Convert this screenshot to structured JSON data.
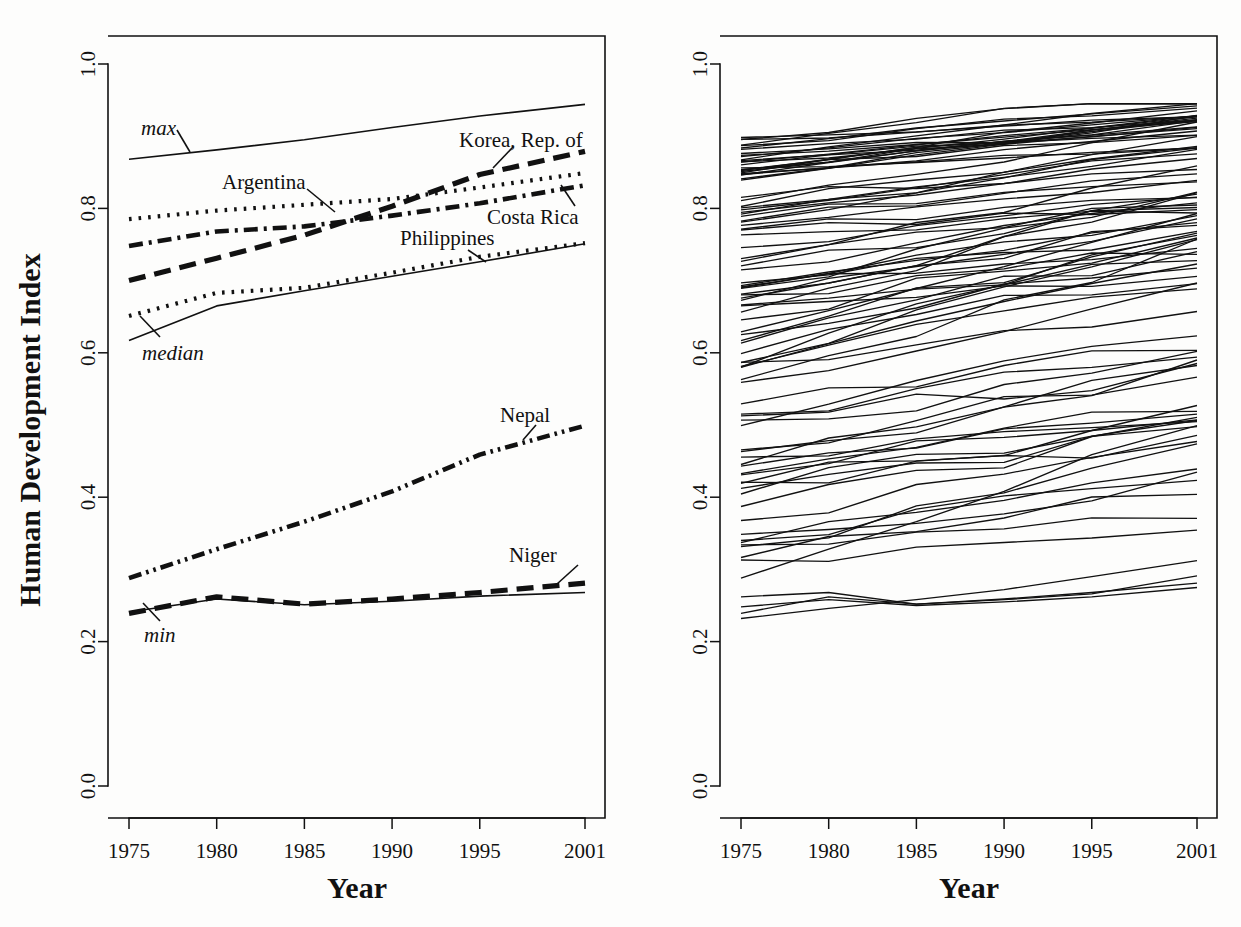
{
  "figure": {
    "panels": [
      {
        "id": "left",
        "xlabel": "Year",
        "ylabel": "Human Development Index"
      },
      {
        "id": "right",
        "xlabel": "Year",
        "ylabel": ""
      }
    ]
  },
  "chart_data": {
    "type": "line",
    "title": "",
    "xlabel": "Year",
    "ylabel": "Human Development Index",
    "xlim": [
      1975,
      2001
    ],
    "ylim": [
      0.0,
      1.0
    ],
    "xticks": [
      1975,
      1980,
      1985,
      1990,
      1995,
      2001
    ],
    "xticklabels": [
      "1975",
      "1980",
      "1985",
      "1990",
      "1995",
      "2001"
    ],
    "yticks": [
      0.0,
      0.2,
      0.4,
      0.6,
      0.8,
      1.0
    ],
    "yticklabels": [
      "0.0",
      "0.2",
      "0.4",
      "0.6",
      "0.8",
      "1.0"
    ],
    "grid": false,
    "legend": "none (direct labels with leader lines)",
    "x": [
      1975,
      1980,
      1985,
      1990,
      1995,
      2001
    ],
    "panels": [
      {
        "name": "left-highlighted-series",
        "description": "Eight highlighted trajectories, direct-labelled on the plot",
        "series": [
          {
            "name": "max",
            "label": "max",
            "style": "solid",
            "values": [
              0.868,
              0.881,
              0.895,
              0.912,
              0.928,
              0.944
            ]
          },
          {
            "name": "Korea, Rep. of",
            "label": "Korea, Rep. of",
            "style": "dashed",
            "values": [
              0.7,
              0.731,
              0.763,
              0.803,
              0.847,
              0.879
            ]
          },
          {
            "name": "Argentina",
            "label": "Argentina",
            "style": "dotted",
            "values": [
              0.785,
              0.797,
              0.805,
              0.813,
              0.829,
              0.849
            ]
          },
          {
            "name": "Costa Rica",
            "label": "Costa Rica",
            "style": "dashdot",
            "values": [
              0.748,
              0.768,
              0.775,
              0.79,
              0.807,
              0.832
            ]
          },
          {
            "name": "Philippines",
            "label": "Philippines",
            "style": "dotted",
            "values": [
              0.651,
              0.683,
              0.69,
              0.711,
              0.733,
              0.752
            ]
          },
          {
            "name": "median",
            "label": "median",
            "style": "solid",
            "values": [
              0.617,
              0.665,
              0.686,
              0.706,
              0.726,
              0.751
            ]
          },
          {
            "name": "Nepal",
            "label": "Nepal",
            "style": "dashdotdot",
            "values": [
              0.288,
              0.328,
              0.366,
              0.408,
              0.459,
              0.499
            ]
          },
          {
            "name": "Niger",
            "label": "Niger",
            "style": "dashed",
            "values": [
              0.239,
              0.262,
              0.252,
              0.259,
              0.268,
              0.281
            ]
          },
          {
            "name": "min",
            "label": "min",
            "style": "solid",
            "values": [
              0.241,
              0.259,
              0.251,
              0.256,
              0.263,
              0.268
            ]
          }
        ]
      },
      {
        "name": "right-all-countries",
        "description": "Spaghetti plot of all country trajectories, 1975-2001",
        "n_series": 95,
        "value_range": [
          0.23,
          0.945
        ]
      }
    ]
  },
  "annotations": {
    "max": "max",
    "median": "median",
    "min": "min",
    "korea": "Korea, Rep. of",
    "argentina": "Argentina",
    "costa_rica": "Costa Rica",
    "philippines": "Philippines",
    "nepal": "Nepal",
    "niger": "Niger"
  },
  "colors": {
    "ink": "#111111",
    "background": "#fdfdfc"
  }
}
